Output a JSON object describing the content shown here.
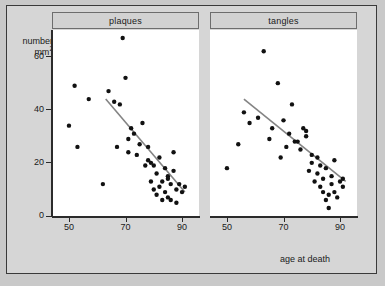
{
  "figure": {
    "background_color": "#d6d6d6",
    "panel_background_color": "#ffffff",
    "frame_color": "#3a3a3a",
    "point_color": "#111111",
    "line_color": "#848484"
  },
  "axes": {
    "y_label_line1": "number",
    "y_label_line2": "mm",
    "y_label_exponent": "2",
    "x_label": "age at death",
    "y_ticks": [
      "0",
      "20",
      "40",
      "60"
    ],
    "x_ticks": [
      "50",
      "70",
      "90"
    ]
  },
  "panels": [
    {
      "title": "plaques"
    },
    {
      "title": "tangles"
    }
  ],
  "chart_data": {
    "type": "scatter",
    "title": "",
    "xlabel": "age at death",
    "ylabel": "number mm2",
    "xlim": [
      44,
      96
    ],
    "ylim": [
      0,
      70
    ],
    "xticks": [
      50,
      70,
      90
    ],
    "yticks": [
      0,
      20,
      40,
      60
    ],
    "grid": false,
    "legend": "none",
    "facets": [
      {
        "name": "plaques",
        "x": [
          50,
          52,
          53,
          57,
          62,
          64,
          66,
          67,
          68,
          69,
          70,
          71,
          71,
          72,
          73,
          74,
          75,
          76,
          77,
          78,
          78,
          79,
          79,
          80,
          80,
          81,
          81,
          82,
          82,
          83,
          83,
          84,
          84,
          85,
          85,
          85,
          86,
          86,
          87,
          87,
          88,
          88,
          89,
          90,
          91
        ],
        "y": [
          34,
          49,
          26,
          44,
          12,
          47,
          43,
          26,
          42,
          67,
          52,
          29,
          24,
          33,
          31,
          23,
          27,
          35,
          19,
          21,
          26,
          20,
          13,
          19,
          10,
          16,
          8,
          22,
          11,
          13,
          6,
          18,
          9,
          15,
          14,
          7,
          12,
          6,
          24,
          17,
          10,
          5,
          12,
          9,
          11
        ],
        "fit_line": {
          "x": [
            63,
            91
          ],
          "y": [
            44,
            9
          ]
        }
      },
      {
        "name": "tangles",
        "x": [
          50,
          54,
          56,
          58,
          61,
          63,
          65,
          66,
          68,
          69,
          70,
          71,
          72,
          73,
          74,
          75,
          76,
          77,
          78,
          78,
          79,
          80,
          80,
          81,
          82,
          82,
          83,
          83,
          84,
          84,
          85,
          85,
          86,
          86,
          87,
          87,
          88,
          88,
          89,
          90,
          91,
          91
        ],
        "y": [
          18,
          27,
          39,
          35,
          37,
          62,
          29,
          33,
          50,
          22,
          36,
          26,
          31,
          42,
          28,
          28,
          25,
          33,
          32,
          30,
          17,
          20,
          23,
          13,
          22,
          16,
          11,
          19,
          9,
          14,
          6,
          18,
          8,
          3,
          12,
          15,
          9,
          21,
          7,
          13,
          14,
          11
        ],
        "fit_line": {
          "x": [
            56,
            92
          ],
          "y": [
            44,
            13
          ]
        }
      }
    ]
  }
}
